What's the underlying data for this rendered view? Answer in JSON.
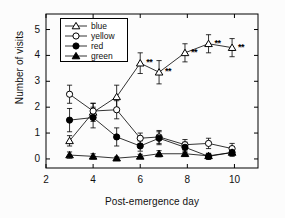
{
  "chart_data": {
    "type": "line",
    "title": "",
    "xlabel": "Post-emergence day",
    "ylabel": "Number of visits",
    "xlim": [
      2,
      11
    ],
    "ylim": [
      -0.35,
      5.6
    ],
    "xticks": [
      2,
      4,
      6,
      8,
      10
    ],
    "yticks": [
      0,
      1,
      2,
      3,
      4,
      5
    ],
    "grid": false,
    "legend_position": "top-left",
    "error_bars": "SEM",
    "x": [
      3,
      4,
      5,
      6,
      6.8,
      7.9,
      8.9,
      9.9
    ],
    "series": [
      {
        "name": "blue",
        "marker": "open-triangle",
        "color": "#000000",
        "values": [
          0.7,
          1.8,
          2.4,
          3.7,
          3.35,
          4.1,
          4.45,
          4.3
        ],
        "errors": [
          0.2,
          0.35,
          0.45,
          0.4,
          0.45,
          0.35,
          0.35,
          0.35
        ]
      },
      {
        "name": "yellow",
        "marker": "open-circle",
        "color": "#000000",
        "values": [
          2.5,
          1.85,
          1.9,
          0.8,
          0.85,
          0.55,
          0.6,
          0.4
        ],
        "errors": [
          0.35,
          0.3,
          0.35,
          0.2,
          0.25,
          0.2,
          0.2,
          0.2
        ]
      },
      {
        "name": "red",
        "marker": "filled-circle",
        "color": "#000000",
        "values": [
          1.5,
          1.6,
          0.85,
          0.5,
          0.8,
          0.45,
          0.1,
          0.25
        ],
        "errors": [
          0.45,
          0.4,
          0.35,
          0.2,
          0.25,
          0.2,
          0.12,
          0.15
        ]
      },
      {
        "name": "green",
        "marker": "filled-triangle",
        "color": "#000000",
        "values": [
          0.15,
          0.1,
          0.03,
          0.1,
          0.2,
          0.2,
          0.12,
          0.25
        ],
        "errors": [
          0.12,
          0.1,
          0.05,
          0.08,
          0.12,
          0.1,
          0.08,
          0.12
        ]
      }
    ],
    "annotations": [
      {
        "text": "**",
        "x": 6,
        "y": 3.7
      },
      {
        "text": "**",
        "x": 6.8,
        "y": 3.35
      },
      {
        "text": "**",
        "x": 7.9,
        "y": 4.1
      },
      {
        "text": "**",
        "x": 8.9,
        "y": 4.45
      },
      {
        "text": "**",
        "x": 9.9,
        "y": 4.3
      }
    ]
  },
  "axes": {
    "ylabel": "Number of visits",
    "xlabel": "Post-emergence day",
    "ytick_labels": [
      "5",
      "4",
      "3",
      "2",
      "1",
      "0"
    ],
    "xtick_labels": [
      "2",
      "4",
      "6",
      "8",
      "10"
    ]
  },
  "legend": {
    "items": [
      {
        "label": "blue",
        "marker": "open-triangle"
      },
      {
        "label": "yellow",
        "marker": "open-circle"
      },
      {
        "label": "red",
        "marker": "filled-circle"
      },
      {
        "label": "green",
        "marker": "filled-triangle"
      }
    ]
  },
  "significance": {
    "symbol": "**"
  }
}
